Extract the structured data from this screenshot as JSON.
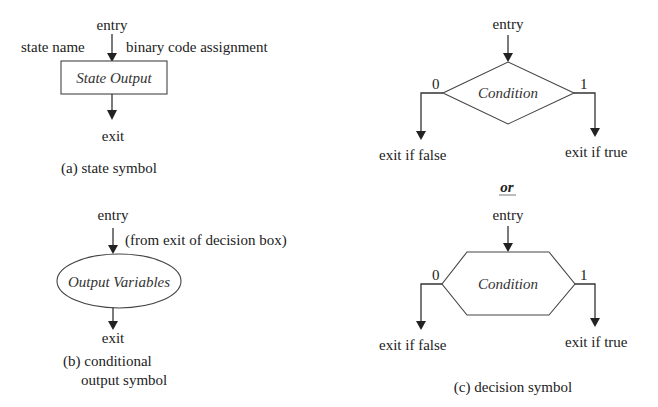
{
  "colors": {
    "background": "#ffffff",
    "text": "#222222",
    "lines": "#333333"
  },
  "state_symbol": {
    "entry_label": "entry",
    "state_name_label": "state name",
    "binary_code_label": "binary code assignment",
    "box_text": "State Output",
    "exit_label": "exit",
    "caption": "(a) state symbol"
  },
  "conditional_output_symbol": {
    "entry_label": "entry",
    "entry_note": "(from exit of decision box)",
    "ellipse_text": "Output Variables",
    "exit_label": "exit",
    "caption_line1": "(b) conditional",
    "caption_line2": "output symbol"
  },
  "decision_diamond": {
    "entry_label": "entry",
    "shape_text": "Condition",
    "false_branch_value": "0",
    "true_branch_value": "1",
    "false_exit_label": "exit if false",
    "true_exit_label": "exit if true"
  },
  "separator_label": "or",
  "decision_hexagon": {
    "entry_label": "entry",
    "shape_text": "Condition",
    "false_branch_value": "0",
    "true_branch_value": "1",
    "false_exit_label": "exit if false",
    "true_exit_label": "exit if true",
    "caption": "(c) decision symbol"
  }
}
